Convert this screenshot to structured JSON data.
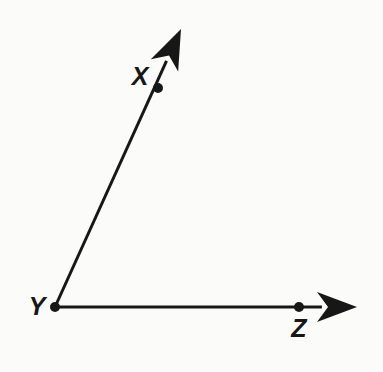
{
  "figure": {
    "kind": "geometry-diagram",
    "background_color": "#fbfbfa",
    "ink_color": "#171717",
    "width": 383,
    "height": 372,
    "stroke_width": 3,
    "point_radius": 5.0,
    "labels": [
      {
        "id": "label-x",
        "text": "X",
        "x": 140,
        "y": 76
      },
      {
        "id": "label-y",
        "text": "Y",
        "x": 37,
        "y": 306
      },
      {
        "id": "label-z",
        "text": "Z",
        "x": 299,
        "y": 328
      }
    ],
    "points": [
      {
        "id": "point-x",
        "name": "X",
        "x": 158,
        "y": 88
      },
      {
        "id": "point-y",
        "name": "Y",
        "x": 55,
        "y": 307
      },
      {
        "id": "point-z",
        "name": "Z",
        "x": 299,
        "y": 307
      }
    ],
    "rays": [
      {
        "id": "ray-yx",
        "name": "ray-YX",
        "from": "Y",
        "through": "X",
        "start_x": 55,
        "start_y": 307,
        "tip_x": 181,
        "tip_y": 29,
        "arrowhead": "barbed",
        "angle_degrees": 65.6
      },
      {
        "id": "ray-yz",
        "name": "ray-YZ",
        "from": "Y",
        "through": "Z",
        "start_x": 55,
        "start_y": 307,
        "tip_x": 357,
        "tip_y": 307,
        "arrowhead": "barbed",
        "angle_degrees": 0
      }
    ],
    "arrowhead": {
      "length": 40,
      "half_width": 15,
      "notch": 11
    }
  }
}
